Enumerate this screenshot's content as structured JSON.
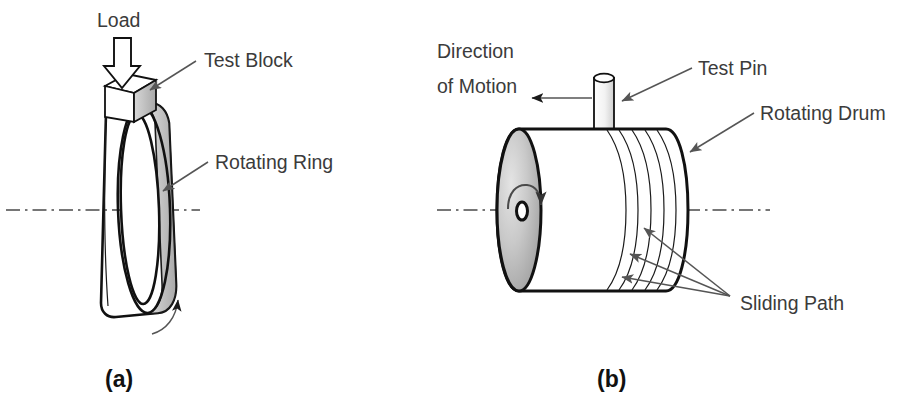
{
  "figure": {
    "background_color": "#ffffff",
    "text_color": "#3b3b3b",
    "line_color": "#555555",
    "outline_color": "#111111",
    "shade_color": "#b6b6b6",
    "bottom_caption": ""
  },
  "panel_a": {
    "panel_label": "(a)",
    "labels": {
      "load": "Load",
      "test_block": "Test Block",
      "rotating_ring": "Rotating Ring"
    },
    "icons": {
      "load_arrow": "down-block-arrow-icon",
      "rotation_arrow": "curved-rotation-arrow-icon",
      "axis": "center-axis-dash-dot-line"
    }
  },
  "panel_b": {
    "panel_label": "(b)",
    "labels": {
      "direction_of_motion_line1": "Direction",
      "direction_of_motion_line2": "of Motion",
      "test_pin": "Test Pin",
      "rotating_drum": "Rotating Drum",
      "sliding_path": "Sliding Path"
    },
    "icons": {
      "motion_arrow": "left-arrow-icon",
      "rotation_arrow": "circular-rotation-arrow-icon",
      "axis": "center-axis-dash-dot-line"
    },
    "sliding_path_count": 5,
    "leader_line_count": 3
  }
}
